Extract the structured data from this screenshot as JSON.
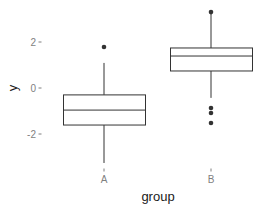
{
  "chart_data": {
    "type": "boxplot",
    "title": "",
    "xlabel": "group",
    "ylabel": "y",
    "categories": [
      "A",
      "B"
    ],
    "y_ticks": [
      2,
      0,
      -2
    ],
    "y_tick_labels": [
      "2",
      "0",
      "-2"
    ],
    "ylim": [
      -3.5,
      3.6
    ],
    "grid": false,
    "legend": null,
    "series": [
      {
        "name": "A",
        "whisker_low": -3.26,
        "q1": -1.61,
        "median": -0.96,
        "q3": -0.3,
        "whisker_high": 1.09,
        "outliers": [
          1.78
        ]
      },
      {
        "name": "B",
        "whisker_low": -0.43,
        "q1": 0.74,
        "median": 1.39,
        "q3": 1.74,
        "whisker_high": 3.3,
        "outliers": [
          3.3,
          -0.87,
          -1.09,
          -1.52
        ]
      }
    ]
  },
  "colors": {
    "box_stroke": "#333333",
    "tick_text": "#7f7f7f",
    "axis_title": "#1a1a1a",
    "background": "#ffffff"
  }
}
